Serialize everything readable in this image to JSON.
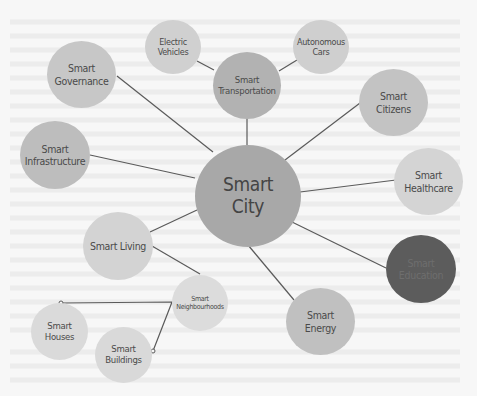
{
  "diagram": {
    "center": {
      "label": "Smart\nCity"
    },
    "nodes": [
      {
        "id": "governance",
        "label": "Smart\nGovernance"
      },
      {
        "id": "electric-vehicles",
        "label": "Electric\nVehicles"
      },
      {
        "id": "transportation",
        "label": "Smart\nTransportation"
      },
      {
        "id": "autonomous-cars",
        "label": "Autonomous\nCars"
      },
      {
        "id": "citizens",
        "label": "Smart\nCitizens"
      },
      {
        "id": "infrastructure",
        "label": "Smart\nInfrastructure"
      },
      {
        "id": "healthcare",
        "label": "Smart\nHealthcare"
      },
      {
        "id": "living",
        "label": "Smart Living"
      },
      {
        "id": "neighbourhoods",
        "label": "Smart\nNeighbourhoods"
      },
      {
        "id": "education",
        "label": "Smart\nEducation"
      },
      {
        "id": "houses",
        "label": "Smart\nHouses"
      },
      {
        "id": "buildings",
        "label": "Smart\nBuildings"
      },
      {
        "id": "energy",
        "label": "Smart\nEnergy"
      }
    ],
    "colors": {
      "center": "#a6a6a6",
      "medium": "#b8b8b8",
      "light": "#cfcfcf",
      "lighter": "#dcdcdc",
      "dark": "#5c5c5c",
      "edge": "#555555"
    }
  }
}
